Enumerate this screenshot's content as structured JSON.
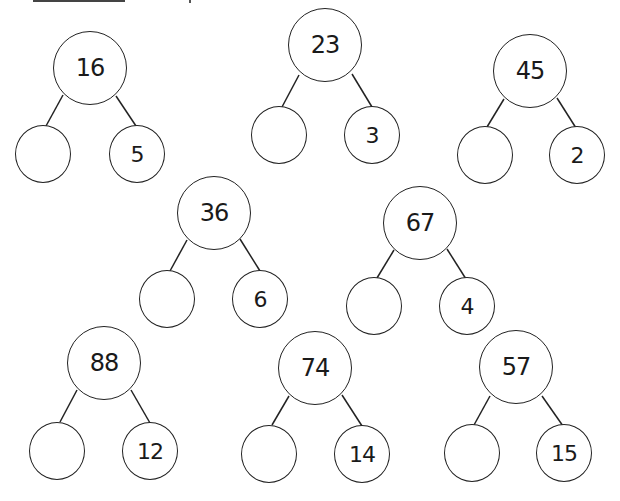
{
  "worksheet": {
    "type": "number bond subtraction",
    "trees": [
      {
        "whole": "16",
        "part_known": "5",
        "part_blank": ""
      },
      {
        "whole": "23",
        "part_known": "3",
        "part_blank": ""
      },
      {
        "whole": "45",
        "part_known": "2",
        "part_blank": ""
      },
      {
        "whole": "36",
        "part_known": "6",
        "part_blank": ""
      },
      {
        "whole": "67",
        "part_known": "4",
        "part_blank": ""
      },
      {
        "whole": "88",
        "part_known": "12",
        "part_blank": ""
      },
      {
        "whole": "74",
        "part_known": "14",
        "part_blank": ""
      },
      {
        "whole": "57",
        "part_known": "15",
        "part_blank": ""
      }
    ]
  }
}
